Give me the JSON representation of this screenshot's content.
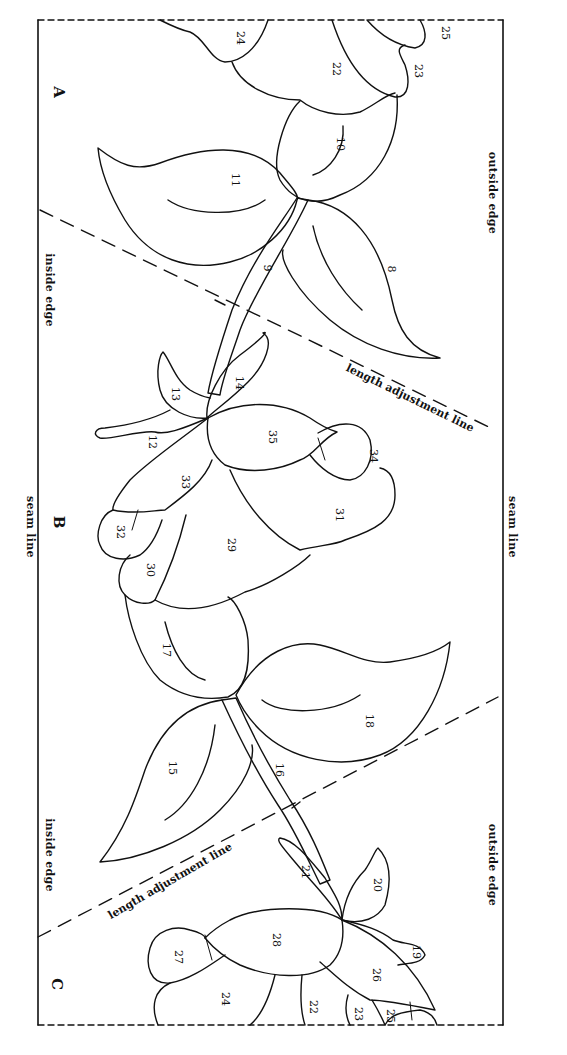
{
  "page": {
    "type": "applique border pattern",
    "border_color": "#111111",
    "background": "#ffffff"
  },
  "edges": {
    "outside_edge_top": "outside edge",
    "outside_edge_bottom": "outside edge",
    "inside_edge_top": "inside edge",
    "inside_edge_bottom": "inside edge",
    "seam_line_left": "seam line",
    "seam_line_right": "seam line"
  },
  "sections": {
    "a": "A",
    "b": "B",
    "c": "C"
  },
  "adjustment_lines": {
    "upper": "length adjustment line",
    "lower": "length adjustment line"
  },
  "pieces": {
    "p24_top": "24",
    "p25_top": "25",
    "p22_top": "22",
    "p23_top": "23",
    "p10": "10",
    "p11": "11",
    "p8": "8",
    "p9": "9",
    "p13": "13",
    "p14": "14",
    "p12": "12",
    "p35": "35",
    "p34": "34",
    "p33": "33",
    "p31": "31",
    "p32": "32",
    "p29": "29",
    "p30": "30",
    "p17": "17",
    "p18": "18",
    "p15": "15",
    "p16": "16",
    "p21": "21",
    "p20": "20",
    "p19": "19",
    "p28": "28",
    "p27": "27",
    "p26": "26",
    "p24_bottom": "24",
    "p22_bottom": "22",
    "p23_bottom": "23",
    "p25_bottom": "25"
  }
}
